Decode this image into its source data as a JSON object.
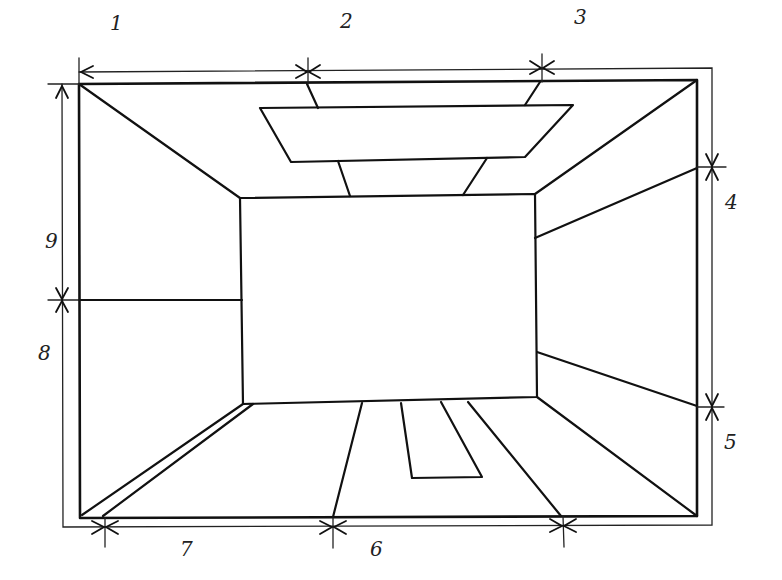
{
  "diagram": {
    "stroke_color": "#111111",
    "background": "#ffffff",
    "labels": [
      {
        "id": "1",
        "text": "1",
        "x": 110,
        "y": 30,
        "position": "top-left segment"
      },
      {
        "id": "2",
        "text": "2",
        "x": 340,
        "y": 28,
        "position": "top-middle segment"
      },
      {
        "id": "3",
        "text": "3",
        "x": 574,
        "y": 24,
        "position": "top-right segment"
      },
      {
        "id": "4",
        "text": "4",
        "x": 725,
        "y": 209,
        "position": "right-upper segment"
      },
      {
        "id": "5",
        "text": "5",
        "x": 724,
        "y": 449,
        "position": "right-lower segment"
      },
      {
        "id": "6",
        "text": "6",
        "x": 370,
        "y": 556,
        "position": "bottom-middle segment"
      },
      {
        "id": "7",
        "text": "7",
        "x": 180,
        "y": 556,
        "position": "bottom-left segment"
      },
      {
        "id": "8",
        "text": "8",
        "x": 38,
        "y": 360,
        "position": "left-lower segment"
      },
      {
        "id": "9",
        "text": "9",
        "x": 45,
        "y": 248,
        "position": "left-upper segment"
      }
    ],
    "elements": {
      "room_outline": "outer frame of room",
      "back_wall": "inner rectangle (far wall)",
      "ceiling_light": "trapezoid ceiling panel with supports",
      "floor_rug": "rug trapezoid on floor",
      "floor_strip": "double-line skirting strip on left floor",
      "dimension_lines": "outer dimension chain with arrow ticks"
    }
  }
}
